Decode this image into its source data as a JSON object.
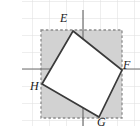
{
  "figure": {
    "problem_number": "7.",
    "width": 140,
    "height": 126,
    "background_color": "#ffffff"
  },
  "grid": {
    "visible": true,
    "line_color": "#dcdcdc",
    "spacing_px": 17,
    "origin_x": 83,
    "origin_y": 69
  },
  "axes": {
    "color": "#7a7a7a",
    "vertical_x": 83,
    "horizontal_y": 69,
    "vertical_top": 10,
    "vertical_bottom": 126,
    "horizontal_left": 22,
    "horizontal_right": 140
  },
  "shaded_square": {
    "name": "dashed-shaded-square",
    "fill_color": "#d0d0d0",
    "stroke_color": "#8c8c8c",
    "stroke_style": "dashed",
    "left": 41,
    "top": 30,
    "right": 122,
    "bottom": 118
  },
  "inner_quadrilateral": {
    "name": "inscribed-quadrilateral-EFGH",
    "fill_color": "#ffffff",
    "stroke_color": "#3a3a3a",
    "stroke_width": 1.6,
    "vertices": [
      {
        "label": "E",
        "x": 73,
        "y": 31
      },
      {
        "label": "F",
        "x": 122,
        "y": 70
      },
      {
        "label": "G",
        "x": 99,
        "y": 117
      },
      {
        "label": "H",
        "x": 42,
        "y": 84
      }
    ]
  },
  "labels": {
    "E": "E",
    "F": "F",
    "G": "G",
    "H": "H"
  }
}
